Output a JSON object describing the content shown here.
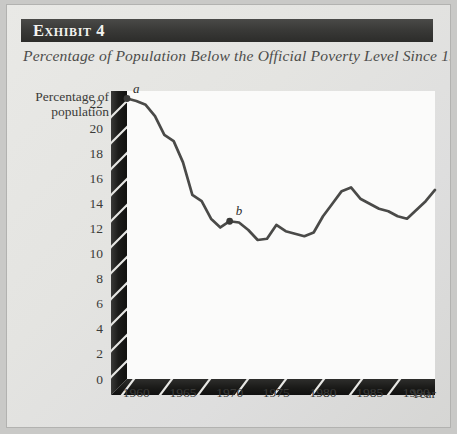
{
  "exhibit": {
    "header_label": "Exhibit 4",
    "subtitle": "Percentage of Population Below the Official Poverty Level Since 1959"
  },
  "colors": {
    "page_background": "#c9c9c7",
    "figure_background": "#e6e6e3",
    "header_bar": "#343432",
    "header_text": "#f2f2ef",
    "axis_bar": "#1f1f1d",
    "axis_hatch": "#e8e8e5",
    "plot_area": "#fbfbfa",
    "data_line": "#4a4a48",
    "tick_text": "#3b3b39"
  },
  "chart_data": {
    "type": "line",
    "title": "Percentage of Population Below the Official Poverty Level Since 1959",
    "xlabel": "Year",
    "ylabel": "Percentage of population",
    "grid": false,
    "legend": "none",
    "xlim": [
      1959,
      1992
    ],
    "ylim": [
      0,
      23
    ],
    "xticks": [
      1960,
      1965,
      1970,
      1975,
      1980,
      1985,
      1990
    ],
    "xtick_labels": [
      "1960",
      "1965",
      "1970",
      "1975",
      "1980",
      "1985",
      "1990"
    ],
    "yticks": [
      0,
      2,
      4,
      6,
      8,
      10,
      12,
      14,
      16,
      18,
      20,
      22
    ],
    "ytick_labels": [
      "0",
      "2",
      "4",
      "6",
      "8",
      "10",
      "12",
      "14",
      "16",
      "18",
      "20",
      "22"
    ],
    "series": [
      {
        "name": "Percentage of population below poverty level",
        "x": [
          1959,
          1960,
          1961,
          1962,
          1963,
          1964,
          1965,
          1966,
          1967,
          1968,
          1969,
          1970,
          1971,
          1972,
          1973,
          1974,
          1975,
          1976,
          1977,
          1978,
          1979,
          1980,
          1981,
          1982,
          1983,
          1984,
          1985,
          1986,
          1987,
          1988,
          1989,
          1990,
          1991,
          1992
        ],
        "values": [
          22.4,
          22.2,
          21.9,
          21.0,
          19.5,
          19.0,
          17.3,
          14.7,
          14.2,
          12.8,
          12.1,
          12.6,
          12.5,
          11.9,
          11.1,
          11.2,
          12.3,
          11.8,
          11.6,
          11.4,
          11.7,
          13.0,
          14.0,
          15.0,
          15.3,
          14.4,
          14.0,
          13.6,
          13.4,
          13.0,
          12.8,
          13.5,
          14.2,
          15.1
        ]
      }
    ],
    "annotations": [
      {
        "label": "a",
        "x": 1959,
        "y": 22.4,
        "marker": "dot"
      },
      {
        "label": "b",
        "x": 1970,
        "y": 12.6,
        "marker": "dot"
      }
    ]
  }
}
